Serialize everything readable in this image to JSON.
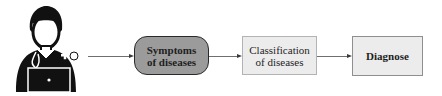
{
  "diagram": {
    "actor": {
      "icon": "doctor-with-laptop-icon",
      "description": "doctor with stethoscope using laptop"
    },
    "nodes": [
      {
        "id": "symptoms",
        "label": "Symptoms of diseases",
        "shape": "rounded-rectangle",
        "fill": "#9b9b9b",
        "border": "#2a2a2a"
      },
      {
        "id": "classification",
        "label": "Classification of diseases",
        "shape": "rectangle",
        "fill": "#ececec",
        "border": "#b3b3b3"
      },
      {
        "id": "diagnose",
        "label": "Diagnose",
        "shape": "rectangle",
        "fill": "#ececec",
        "border": "#8f8f8f"
      }
    ],
    "edges": [
      {
        "from": "actor",
        "to": "symptoms"
      },
      {
        "from": "symptoms",
        "to": "classification"
      },
      {
        "from": "classification",
        "to": "diagnose"
      }
    ]
  }
}
